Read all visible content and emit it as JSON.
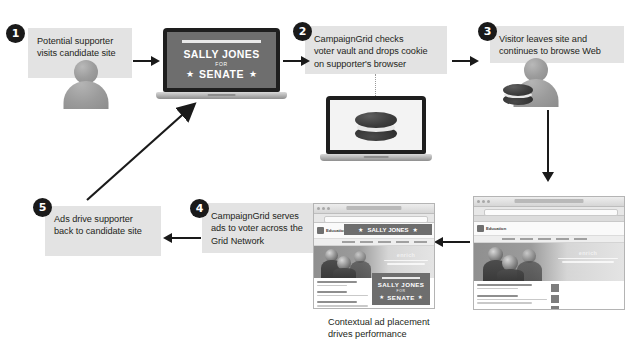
{
  "diagram": {
    "accent_color": "#1a1a1a",
    "label_background": "#e3e3e3",
    "steps": [
      {
        "number": "1",
        "lines": [
          "Potential supporter",
          "visits candidate site"
        ],
        "icon": "person-icon"
      },
      {
        "number": "2",
        "lines": [
          "CampaignGrid checks",
          "voter vault and drops cookie",
          "on supporter's browser"
        ],
        "icon": "laptop-cookie-icon"
      },
      {
        "number": "3",
        "lines": [
          "Visitor leaves site and",
          "continues to browse Web"
        ],
        "icon": "person-with-cookie-icon"
      },
      {
        "number": "4",
        "lines": [
          "CampaignGrid serves",
          "ads to voter across the",
          "Grid Network"
        ],
        "icon": "browser-with-ads-icon"
      },
      {
        "number": "5",
        "lines": [
          "Ads drive supporter",
          "back to candidate site"
        ],
        "icon": "arrow-icon"
      }
    ],
    "caption": {
      "lines": [
        "Contextual ad placement",
        "drives performance"
      ]
    },
    "campaign_poster": {
      "name": "SALLY JONES",
      "for": "FOR",
      "office": "SENATE",
      "star": "★"
    },
    "site": {
      "logo_text": "Education",
      "hero_headline": "enrich"
    }
  }
}
